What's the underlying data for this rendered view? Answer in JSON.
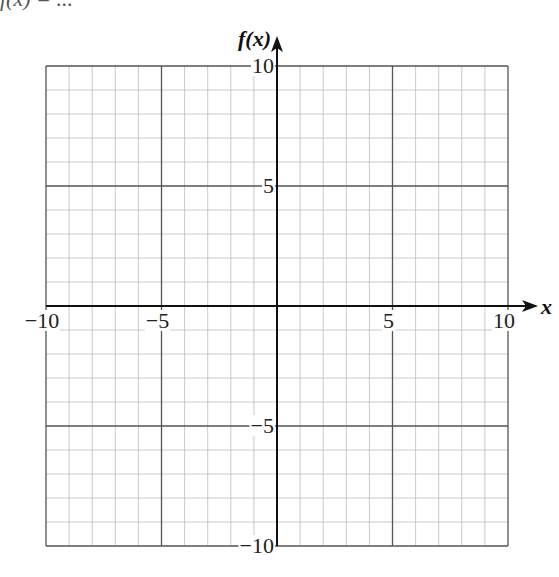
{
  "header": {
    "clipped_text": "f(x) = ..."
  },
  "chart_data": {
    "type": "line",
    "title": "",
    "xlabel": "x",
    "ylabel": "f(x)",
    "xlim": [
      -10,
      10
    ],
    "ylim": [
      -10,
      10
    ],
    "grid": true,
    "minor_step": 1,
    "major_step": 5,
    "series": [],
    "x_ticks": [
      {
        "value": -10,
        "label": "−10"
      },
      {
        "value": -5,
        "label": "−5"
      },
      {
        "value": 5,
        "label": "5"
      },
      {
        "value": 10,
        "label": "10"
      }
    ],
    "y_ticks": [
      {
        "value": 10,
        "label": "10"
      },
      {
        "value": 5,
        "label": "5"
      },
      {
        "value": -5,
        "label": "−5"
      },
      {
        "value": -10,
        "label": "−10"
      }
    ],
    "colors": {
      "minor_grid": "#bdbdbd",
      "major_grid": "#555555",
      "axis": "#111111"
    }
  }
}
